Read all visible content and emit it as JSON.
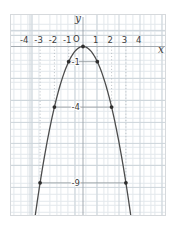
{
  "figure": {
    "y_axis_label": "y",
    "x_axis_label": "x",
    "origin_label": "O"
  },
  "chart_data": {
    "type": "line",
    "title": "",
    "curve_equation": "y = -x^2",
    "x_tick_values": [
      -4,
      -3,
      -2,
      -1,
      1,
      2,
      3,
      4
    ],
    "x_tick_labels": [
      "-4",
      "-3",
      "-2",
      "-1",
      "1",
      "2",
      "3",
      "4"
    ],
    "y_tick_values": [
      -1,
      -4,
      -9
    ],
    "y_tick_labels": [
      "-1",
      "-4",
      "-9"
    ],
    "marked_points": [
      [
        -3,
        -9
      ],
      [
        -2,
        -4
      ],
      [
        -1,
        -1
      ],
      [
        0,
        0
      ],
      [
        1,
        -1
      ],
      [
        2,
        -4
      ],
      [
        3,
        -9
      ]
    ],
    "horizontal_guides": [
      {
        "y": -1,
        "x1": -1,
        "x2": 1
      },
      {
        "y": -4,
        "x1": -2,
        "x2": 2
      },
      {
        "y": -9,
        "x1": -3,
        "x2": 3
      }
    ],
    "vertical_dotted_guides": [
      {
        "x": -1,
        "y1": 0,
        "y2": -1
      },
      {
        "x": 1,
        "y1": 0,
        "y2": -1
      },
      {
        "x": -2,
        "y1": 0,
        "y2": -4
      },
      {
        "x": 2,
        "y1": 0,
        "y2": -4
      },
      {
        "x": -3,
        "y1": 0,
        "y2": -9
      },
      {
        "x": 3,
        "y1": 0,
        "y2": -9
      }
    ],
    "xlim": [
      -5.1,
      5.8
    ],
    "ylim": [
      -11.2,
      2.2
    ],
    "grid": true,
    "legend": false,
    "colors": {
      "curve": "#4c4c4c",
      "points": "#2e2e2e",
      "axis": "#9aa1a8",
      "guide": "#8f959b",
      "dotted_guide": "#aab0b6",
      "grid_fine": "#e3e8ec",
      "grid_major": "#ccd4da",
      "text": "#3c3c3c",
      "frame_border": "#d6d9dc",
      "background": "#ffffff"
    }
  }
}
